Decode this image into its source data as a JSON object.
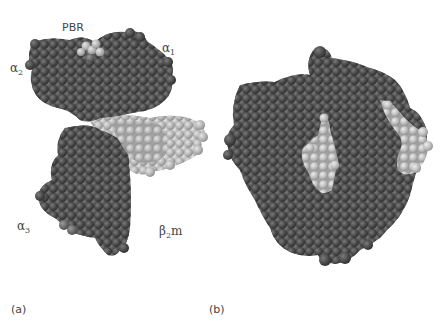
{
  "figure": {
    "panels": [
      {
        "id": "a",
        "letter": "(a)",
        "description": "Side view of MHC class I molecule, space-filling model",
        "labels": {
          "pbr": "PBR",
          "alpha1": {
            "base": "α",
            "sub": "1"
          },
          "alpha2": {
            "base": "α",
            "sub": "2"
          },
          "alpha3": {
            "base": "α",
            "sub": "3"
          },
          "b2m": {
            "base": "β",
            "sub": "2",
            "suffix": "m"
          }
        }
      },
      {
        "id": "b",
        "letter": "(b)",
        "description": "Top view of MHC class I molecule showing peptide-binding groove"
      }
    ],
    "colors": {
      "heavy_chain": "#4a4a4a",
      "heavy_chain_dark": "#3a3a3a",
      "b2m": "#b8b8b8",
      "peptide": "#c8c8c8",
      "background": "#ffffff"
    }
  }
}
